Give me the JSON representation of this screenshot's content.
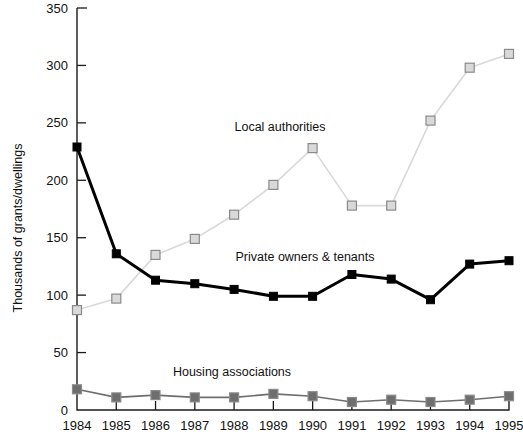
{
  "chart_data": {
    "type": "line",
    "title": "",
    "xlabel": "",
    "ylabel": "Thousands of grants/dwellings",
    "categories": [
      "1984",
      "1985",
      "1986",
      "1987",
      "1988",
      "1989",
      "1990",
      "1991",
      "1992",
      "1993",
      "1994",
      "1995"
    ],
    "ylim": [
      0,
      350
    ],
    "yticks": [
      0,
      50,
      100,
      150,
      200,
      250,
      300,
      350
    ],
    "ytick_labels": [
      "0",
      "50",
      "100",
      "150",
      "200",
      "250",
      "300",
      "350"
    ],
    "grid": false,
    "legend": "inline-annotations",
    "series": [
      {
        "name": "Local authorities",
        "color": "#d9d9d9",
        "marker": "square",
        "label_x": 280,
        "label_y": 131,
        "values": [
          87,
          97,
          135,
          149,
          170,
          196,
          228,
          178,
          178,
          252,
          298,
          310
        ]
      },
      {
        "name": "Private owners & tenants",
        "color": "#000000",
        "marker": "square",
        "label_x": 305,
        "label_y": 261,
        "values": [
          229,
          136,
          113,
          110,
          105,
          99,
          99,
          118,
          114,
          96,
          127,
          130
        ]
      },
      {
        "name": "Housing associations",
        "color": "#6e6e6e",
        "marker": "square",
        "label_x": 232,
        "label_y": 376,
        "values": [
          18,
          11,
          13,
          11,
          11,
          14,
          12,
          7,
          9,
          7,
          9,
          12
        ]
      }
    ]
  },
  "axis": {
    "y_title": "Thousands of grants/dwellings"
  }
}
